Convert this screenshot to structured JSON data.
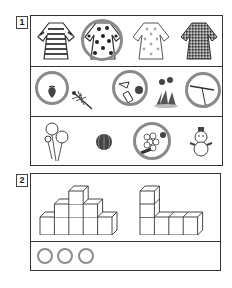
{
  "questions": [
    {
      "number": "1",
      "rows": [
        {
          "items": [
            {
              "name": "striped-dress",
              "circled": false
            },
            {
              "name": "polka-dot-dress",
              "circled": true
            },
            {
              "name": "floral-dotted-dress",
              "circled": false
            },
            {
              "name": "checkered-dress",
              "circled": false
            }
          ]
        },
        {
          "items": [
            {
              "name": "strawberry",
              "circled": true
            },
            {
              "name": "dragonfly",
              "circled": false
            },
            {
              "name": "spray-bottle-and-ball",
              "circled": true
            },
            {
              "name": "dandelion",
              "circled": false
            },
            {
              "name": "bamboo-dragonfly-toy",
              "circled": true
            }
          ]
        },
        {
          "items": [
            {
              "name": "cosmos-flowers",
              "circled": false
            },
            {
              "name": "watermelon",
              "circled": false
            },
            {
              "name": "grapes-and-chestnuts",
              "circled": true
            },
            {
              "name": "snowman",
              "circled": false
            }
          ]
        }
      ]
    },
    {
      "number": "2",
      "figures": [
        {
          "name": "stepped-block-pyramid",
          "columns": [
            1,
            2,
            3,
            2,
            1
          ]
        },
        {
          "name": "l-shaped-blocks",
          "columns": [
            3,
            1,
            1,
            1
          ]
        }
      ],
      "answer": {
        "circles": 3
      }
    }
  ],
  "colors": {
    "line": "#333333",
    "mark": "#8a8a8a",
    "fill_dark": "#555555"
  }
}
